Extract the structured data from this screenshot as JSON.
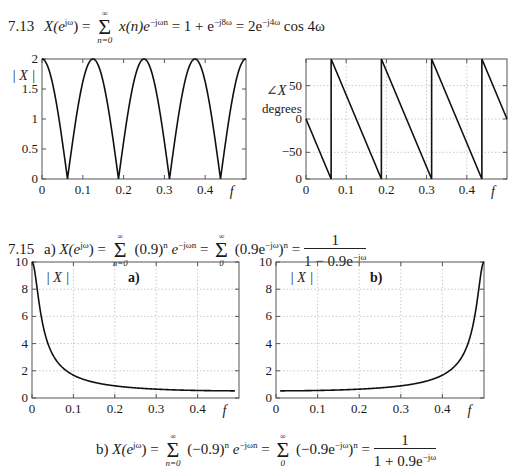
{
  "equations": {
    "eq713": {
      "number": "7.13",
      "lhs": "X(e",
      "lhs_sup": "jω",
      "lhs_close": ") =",
      "sum_top": "∞",
      "sum_bot": "n=0",
      "term1": "x(n)e",
      "term1_sup": "−jωn",
      "rest1": "= 1 + e",
      "rest1_sup": "−j8ω",
      "rest2": "= 2e",
      "rest2_sup": "−j4ω",
      "rest3": "cos 4ω"
    },
    "eq715a": {
      "number": "7.15",
      "part": "a)",
      "lhs": "X(e",
      "lhs_sup": "jω",
      "lhs_close": ") =",
      "sum1_top": "∞",
      "sum1_bot": "n=0",
      "term1": "(0.9)",
      "term1_sup": "n",
      "term1b": "e",
      "term1b_sup": "−jωn",
      "eq2": "=",
      "sum2_top": "∞",
      "sum2_bot": "0",
      "term2": "(0.9e",
      "term2_sup": "−jω",
      "term2_close": ")",
      "term2_close_sup": "n",
      "eq3": "=",
      "frac_num": "1",
      "frac_den": "1 − 0.9e",
      "frac_den_sup": "−jω"
    },
    "eq715b": {
      "part": "b)",
      "lhs": "X(e",
      "lhs_sup": "jω",
      "lhs_close": ") =",
      "sum1_top": "∞",
      "sum1_bot": "n=0",
      "term1": "(−0.9)",
      "term1_sup": "n",
      "term1b": "e",
      "term1b_sup": "−jωn",
      "eq2": "=",
      "sum2_top": "∞",
      "sum2_bot": "0",
      "term2": "(−0.9e",
      "term2_sup": "−jω",
      "term2_close": ")",
      "term2_close_sup": "n",
      "eq3": "=",
      "frac_num": "1",
      "frac_den": "1 + 0.9e",
      "frac_den_sup": "−jω"
    }
  },
  "chart_data": [
    {
      "id": "mag-7-13",
      "type": "line",
      "title": "",
      "xlabel": "f",
      "ylabel": "|X|",
      "xlim": [
        0,
        0.5
      ],
      "ylim": [
        0,
        2
      ],
      "xticks": [
        "0",
        "0.1",
        "0.2",
        "0.3",
        "0.4"
      ],
      "yticks": [
        "0",
        "0.5",
        "1",
        "1.5",
        "2"
      ],
      "grid": false,
      "function": "|2cos(8πf)|",
      "x": [
        0,
        0.0625,
        0.125,
        0.1875,
        0.25,
        0.3125,
        0.375,
        0.4375,
        0.5
      ],
      "values": [
        2,
        0,
        2,
        0,
        2,
        0,
        2,
        0,
        2
      ]
    },
    {
      "id": "phase-7-13",
      "type": "line",
      "title": "",
      "xlabel": "f",
      "ylabel": "∠X degrees",
      "xlim": [
        0,
        0.5
      ],
      "ylim": [
        -90,
        90
      ],
      "xticks": [
        "0",
        "0.1",
        "0.2",
        "0.3",
        "0.4"
      ],
      "yticks": [
        "0",
        "−50",
        "0",
        "50"
      ],
      "grid": true,
      "function": "sawtooth phase of e^{-j8πf}·sign(cos 8πf), degrees",
      "x": [
        0,
        0.0625,
        0.0625,
        0.1875,
        0.1875,
        0.3125,
        0.3125,
        0.4375,
        0.4375,
        0.5
      ],
      "values": [
        0,
        -90,
        90,
        -90,
        90,
        -90,
        90,
        -90,
        90,
        0
      ]
    },
    {
      "id": "mag-7-15a",
      "type": "line",
      "title": "a)",
      "xlabel": "f",
      "ylabel": "|X|",
      "xlim": [
        0,
        0.5
      ],
      "ylim": [
        0,
        10
      ],
      "xticks": [
        "0",
        "0.1",
        "0.2",
        "0.3",
        "0.4"
      ],
      "yticks": [
        "0",
        "2",
        "4",
        "6",
        "8",
        "10"
      ],
      "grid": true,
      "function": "1/|1 − 0.9e^{-j2πf}|",
      "x": [
        0,
        0.02,
        0.05,
        0.1,
        0.2,
        0.3,
        0.4,
        0.48
      ],
      "values": [
        10,
        5.8,
        2.7,
        1.5,
        0.8,
        0.6,
        0.54,
        0.53
      ]
    },
    {
      "id": "mag-7-15b",
      "type": "line",
      "title": "b)",
      "xlabel": "f",
      "ylabel": "|X|",
      "xlim": [
        0,
        0.5
      ],
      "ylim": [
        0,
        10
      ],
      "xticks": [
        "0",
        "0.1",
        "0.2",
        "0.3",
        "0.4"
      ],
      "yticks": [
        "0",
        "2",
        "4",
        "6",
        "8",
        "10"
      ],
      "grid": true,
      "function": "1/|1 + 0.9e^{-j2πf}|",
      "x": [
        0,
        0.1,
        0.2,
        0.3,
        0.4,
        0.45,
        0.48,
        0.5
      ],
      "values": [
        0.53,
        0.54,
        0.6,
        0.8,
        1.5,
        2.7,
        5.8,
        10
      ]
    }
  ]
}
